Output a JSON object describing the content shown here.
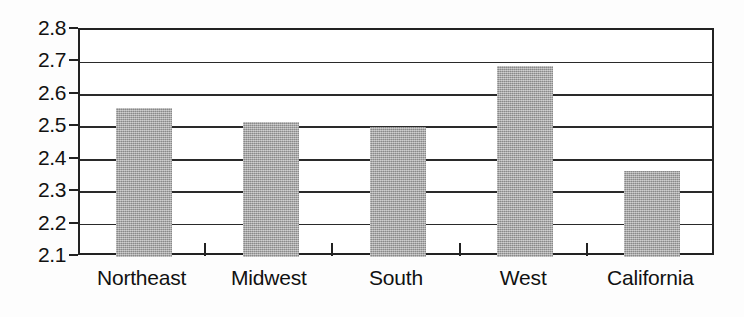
{
  "chart_data": {
    "type": "bar",
    "title": "",
    "subtitle": "",
    "xlabel": "",
    "ylabel": "",
    "categories": [
      "Northeast",
      "Midwest",
      "South",
      "West",
      "California"
    ],
    "values": [
      2.56,
      2.515,
      2.5,
      2.69,
      2.365
    ],
    "series": [
      {
        "name": "",
        "values": [
          2.56,
          2.515,
          2.5,
          2.69,
          2.365
        ]
      }
    ],
    "ylim": [
      2.1,
      2.8
    ],
    "ytick_values": [
      2.8,
      2.7,
      2.6,
      2.5,
      2.4,
      2.3,
      2.2,
      2.1
    ],
    "ytick_labels": [
      "2.8",
      "2.7",
      "2.6",
      "2.5",
      "2.4",
      "2.3",
      "2.2",
      "2.1"
    ],
    "ytick_step": 0.1,
    "grid": true,
    "grid_axis": "y",
    "legend": false,
    "legend_position": "none",
    "bar_color": "#a6a6a6",
    "axis_color": "#222222",
    "background_color": "#ffffff",
    "annotations": []
  },
  "axis": {
    "y": {
      "ticks": [
        {
          "label": "2.8",
          "value": 2.8
        },
        {
          "label": "2.7",
          "value": 2.7
        },
        {
          "label": "2.6",
          "value": 2.6
        },
        {
          "label": "2.5",
          "value": 2.5
        },
        {
          "label": "2.4",
          "value": 2.4
        },
        {
          "label": "2.3",
          "value": 2.3
        },
        {
          "label": "2.2",
          "value": 2.2
        },
        {
          "label": "2.1",
          "value": 2.1
        }
      ]
    },
    "x": {
      "ticks": [
        {
          "label": "Northeast"
        },
        {
          "label": "Midwest"
        },
        {
          "label": "South"
        },
        {
          "label": "West"
        },
        {
          "label": "California"
        }
      ]
    }
  }
}
